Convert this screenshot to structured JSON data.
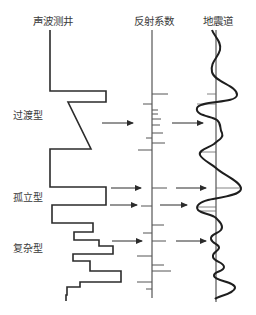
{
  "headers": {
    "sonic_log": "声波测井",
    "reflection_coefficient": "反射系数",
    "seismic_trace": "地震道"
  },
  "patterns": [
    {
      "id": "transitional",
      "label": "过渡型"
    },
    {
      "id": "isolated",
      "label": "孤立型"
    },
    {
      "id": "complex",
      "label": "复杂型"
    }
  ],
  "colors": {
    "line": "#2b2b2b",
    "axis": "#555555",
    "text": "#3a3a3a"
  }
}
